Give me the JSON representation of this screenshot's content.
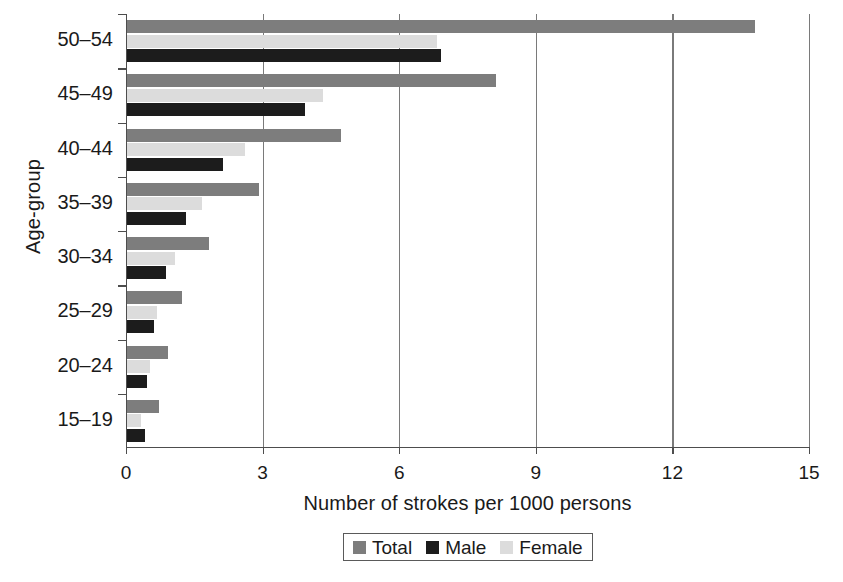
{
  "chart_data": {
    "type": "bar",
    "orientation": "horizontal",
    "title": "",
    "xlabel": "Number of strokes per 1000 persons",
    "ylabel": "Age-group",
    "categories": [
      "15–19",
      "20–24",
      "25–29",
      "30–34",
      "35–39",
      "40–44",
      "45–49",
      "50–54"
    ],
    "series": [
      {
        "name": "Total",
        "color": "#7d7d7d",
        "values": [
          0.7,
          0.9,
          1.2,
          1.8,
          2.9,
          4.7,
          8.1,
          13.8
        ]
      },
      {
        "name": "Male",
        "color": "#1c1c1c",
        "values": [
          0.4,
          0.45,
          0.6,
          0.85,
          1.3,
          2.1,
          3.9,
          6.9
        ]
      },
      {
        "name": "Female",
        "color": "#dcdcdc",
        "values": [
          0.3,
          0.5,
          0.65,
          1.05,
          1.65,
          2.6,
          4.3,
          6.8
        ]
      }
    ],
    "xlim": [
      0,
      15
    ],
    "xticks": [
      0,
      3,
      6,
      9,
      12,
      15
    ],
    "xtick_labels": [
      "0",
      "3",
      "6",
      "9",
      "12",
      "15"
    ],
    "grid": "vertical-at-xticks",
    "legend_position": "bottom-center",
    "legend_entries": [
      "Total",
      "Male",
      "Female"
    ]
  }
}
